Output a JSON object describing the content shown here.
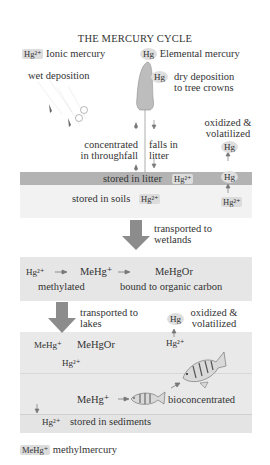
{
  "title": "THE MERCURY CYCLE",
  "legend": {
    "ionic_symbol": "Hg²⁺",
    "ionic_label": "Ionic mercury",
    "elemental_symbol": "Hg",
    "elemental_label": "Elemental mercury",
    "methyl_symbol": "MeHg⁺",
    "methyl_label": "methylmercury"
  },
  "forest": {
    "wet_deposition": "wet deposition",
    "dry_hg": "Hg",
    "dry_deposition_line1": "dry deposition",
    "dry_deposition_line2": "to tree crowns",
    "concentrated_line1": "concentrated",
    "concentrated_line2": "in throughfall",
    "falls_line1": "falls in",
    "falls_line2": "litter",
    "oxidized_line1": "oxidized &",
    "oxidized_line2": "volatilized",
    "volatile_hg_top": "Hg",
    "volatile_hg_mid": "Hg",
    "soil_hg2": "Hg²⁺"
  },
  "litter": {
    "label": "stored in litter",
    "species": "Hg²⁺"
  },
  "soil": {
    "label": "stored in soils",
    "species": "Hg²⁺"
  },
  "transport_wetlands": {
    "line1": "transported to",
    "line2": "wetlands"
  },
  "wetland": {
    "step1": "Hg²⁺",
    "step2": "MeHg⁺",
    "step3": "MeHgOr",
    "label1": "methylated",
    "label2": "bound to organic carbon"
  },
  "transport_lakes": {
    "line1": "transported to",
    "line2": "lakes"
  },
  "lake_volatile": {
    "hg": "Hg",
    "line1": "oxidized &",
    "line2": "volatilized",
    "source": "Hg²⁺"
  },
  "lake": {
    "mehg": "MeHg⁺",
    "mehgor": "MeHgOr",
    "hg2": "Hg²⁺",
    "fish_mehg": "MeHg⁺",
    "bioconcentrated": "bioconcentrated"
  },
  "sediments": {
    "species": "Hg²⁺",
    "label": "stored in sediments"
  },
  "colors": {
    "litter_band": "#b3b3b3",
    "soil_band": "#f2f2f2",
    "box_fill": "#e6e6e6",
    "arrow": "#8c8c8c",
    "tree": "#bdbdbd"
  }
}
